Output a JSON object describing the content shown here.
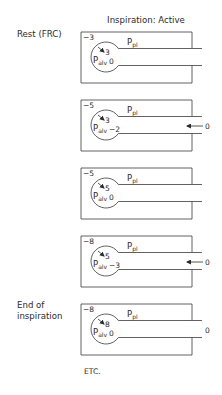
{
  "title": "Inspiration: Active",
  "labels": {
    "rest": "Rest (FRC)",
    "end_line1": "End of",
    "end_line2": "inspiration",
    "etc": "ETC."
  },
  "symbols": {
    "ppl": "P",
    "ppl_sub": "pl",
    "palv": "P",
    "palv_sub": "alv"
  },
  "panels": [
    {
      "stage": "Rest (FRC)",
      "pleural_pressure": "−3",
      "recoil": "3",
      "alveolar_pressure": "0",
      "airflow_arrow": false,
      "mouth_pressure": ""
    },
    {
      "stage": "",
      "pleural_pressure": "−5",
      "recoil": "3",
      "alveolar_pressure": "−2",
      "airflow_arrow": true,
      "mouth_pressure": "0"
    },
    {
      "stage": "",
      "pleural_pressure": "−5",
      "recoil": "5",
      "alveolar_pressure": "0",
      "airflow_arrow": false,
      "mouth_pressure": ""
    },
    {
      "stage": "",
      "pleural_pressure": "−8",
      "recoil": "5",
      "alveolar_pressure": "−3",
      "airflow_arrow": true,
      "mouth_pressure": "0"
    },
    {
      "stage": "End of inspiration",
      "pleural_pressure": "−8",
      "recoil": "8",
      "alveolar_pressure": "0",
      "airflow_arrow": false,
      "mouth_pressure": "0"
    }
  ],
  "colors": {
    "line": "#3a3a3a",
    "text": "#2b2b2b"
  }
}
